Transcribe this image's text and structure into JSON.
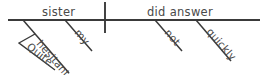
{
  "diagram": {
    "type": "reed-kellogg-sentence-diagram",
    "sentence": "Quite hesitant, my sister did not answer quickly.",
    "ink_color": "#3a3a3a",
    "text_color": "#4a4a4a",
    "background_color": "#ffffff",
    "baseline": {
      "label": "main-baseline",
      "x1": 8,
      "y1": 20,
      "x2": 260,
      "y2": 20
    },
    "divider": {
      "label": "subject-predicate-divider",
      "x": 105,
      "y1": 2,
      "y2": 33
    },
    "subject": {
      "text": "sister",
      "x": 42,
      "y": 16
    },
    "predicate": {
      "text": "did answer",
      "x": 147,
      "y": 16
    },
    "modifiers": [
      {
        "text": "hesitant",
        "attaches_to": "sister",
        "line": {
          "x1": 23,
          "y1": 20,
          "x2": 69,
          "y2": 73
        },
        "text_x": 36,
        "text_y": 44,
        "rotation": 49
      },
      {
        "text": "my",
        "attaches_to": "sister",
        "line": {
          "x1": 65,
          "y1": 20,
          "x2": 92,
          "y2": 51
        },
        "text_x": 74,
        "text_y": 33,
        "rotation": 49
      },
      {
        "text": "not",
        "attaches_to": "did answer",
        "line": {
          "x1": 155,
          "y1": 20,
          "x2": 182,
          "y2": 51
        },
        "text_x": 164,
        "text_y": 33,
        "rotation": 49
      },
      {
        "text": "quickly",
        "attaches_to": "did answer",
        "line": {
          "x1": 196,
          "y1": 20,
          "x2": 231,
          "y2": 61
        },
        "text_x": 206,
        "text_y": 32,
        "rotation": 49
      }
    ],
    "sub_modifiers": [
      {
        "text": "Quite",
        "attaches_to": "hesitant",
        "line": {
          "x1": 35,
          "y1": 34,
          "x2": 19,
          "y2": 43,
          "x3": 55,
          "y3": 70
        },
        "text_x": 26,
        "text_y": 48,
        "rotation": 38
      }
    ]
  }
}
